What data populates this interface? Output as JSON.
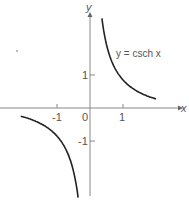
{
  "chart_data": {
    "type": "line",
    "title": "",
    "xlabel": "x",
    "ylabel": "y",
    "annotation": "y = csch x",
    "x_ticks": [
      "-1",
      "0",
      "1"
    ],
    "y_ticks": [
      "1",
      "-1"
    ],
    "xlim": [
      -2.7,
      2.7
    ],
    "ylim": [
      -2.9,
      3.2
    ],
    "grid": false,
    "legend": "none",
    "series": [
      {
        "name": "csch x (x>0)",
        "x": [
          0.35,
          0.5,
          0.75,
          1.0,
          1.25,
          1.5,
          1.75,
          2.0
        ],
        "y": [
          2.79,
          1.92,
          1.22,
          0.85,
          0.62,
          0.47,
          0.36,
          0.28
        ]
      },
      {
        "name": "csch x (x<0)",
        "x": [
          -2.0,
          -1.75,
          -1.5,
          -1.25,
          -1.0,
          -0.75,
          -0.5,
          -0.35
        ],
        "y": [
          -0.28,
          -0.36,
          -0.47,
          -0.62,
          -0.85,
          -1.22,
          -1.92,
          -2.79
        ]
      }
    ]
  },
  "labels": {
    "x_axis": "x",
    "y_axis": "y",
    "equation": "y = csch x",
    "tick_x_neg1": "-1",
    "tick_x_0": "0",
    "tick_x_1": "1",
    "tick_y_1": "1",
    "tick_y_neg1": "-1"
  },
  "colors": {
    "axis": "#888888",
    "curve": "#222222",
    "text": "#555555"
  }
}
